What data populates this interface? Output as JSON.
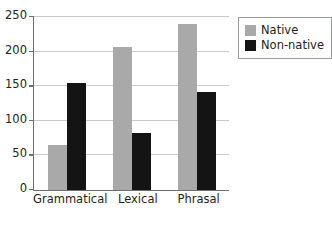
{
  "chart_data": {
    "type": "bar",
    "title": "",
    "subtitle": "",
    "xlabel": "",
    "ylabel": "",
    "categories": [
      "Grammatical",
      "Lexical",
      "Phrasal"
    ],
    "series": [
      {
        "name": "Native",
        "color": "#a9a9a9",
        "values": [
          65,
          207,
          240
        ]
      },
      {
        "name": "Non-native",
        "color": "#141414",
        "values": [
          155,
          82,
          141
        ]
      }
    ],
    "ylim": [
      0,
      250
    ],
    "yticks": [
      0,
      50,
      100,
      150,
      200,
      250
    ],
    "ytick_labels": [
      "0",
      "50",
      "100",
      "150",
      "200",
      "250"
    ],
    "grid": true,
    "legend_position": "top-right",
    "annotations": []
  },
  "legend": {
    "items": [
      {
        "label": "Native",
        "swatch": "native-swatch"
      },
      {
        "label": "Non-native",
        "swatch": "non-native-swatch"
      }
    ]
  }
}
